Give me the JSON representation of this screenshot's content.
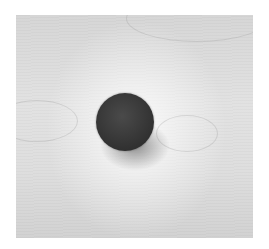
{
  "image": {
    "subject": "dark ball on light wood surface",
    "style": "grayscale photograph",
    "colors": {
      "background": "#ffffff",
      "wood": "#dcdcdc",
      "ball": "#333333"
    }
  }
}
